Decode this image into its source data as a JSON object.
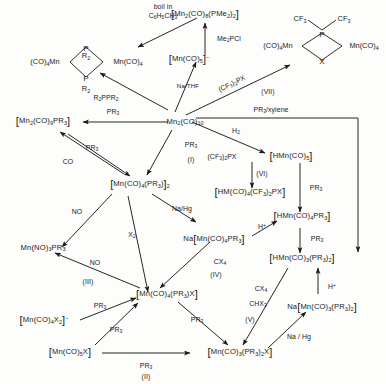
{
  "diagram": {
    "type": "reaction-scheme"
  },
  "structures": {
    "dimer_PR2": {
      "left_label": "(CO)4Mn",
      "right_label": "Mn(CO)4",
      "top_bridge_atom": "P",
      "top_substituent": "R2",
      "bottom_bridge_atom": "P",
      "bottom_substituent": "R2"
    },
    "dimer_CF3_PX": {
      "left_label": "(CO)4Mn",
      "right_label": "Mn(CO)4",
      "top_bridge_atom": "P",
      "top_substituent_left": "CF3",
      "top_substituent_right": "CF3",
      "bottom_bridge_atom": "X"
    }
  },
  "nodes": [
    {
      "id": "mn2co9pme2",
      "text": "[Mn2(CO)8(PMe2)2]"
    },
    {
      "id": "mnco5_anion",
      "text": "[Mn(CO)5]⁻"
    },
    {
      "id": "mn2co9pr3",
      "text": "[Mn2(CO)9PR3]"
    },
    {
      "id": "mn2co10",
      "text": "Mn2(CO)10"
    },
    {
      "id": "hmnco5",
      "text": "[HMn(CO)5]"
    },
    {
      "id": "hmco4cf3px",
      "text": "[HM(CO)4(CF3)2PX]"
    },
    {
      "id": "mnco4pr3_dimer",
      "text": "[Mn(CO)4(PR3)]2"
    },
    {
      "id": "hmnco4pr3",
      "text": "[HMn(CO)4PR3]"
    },
    {
      "id": "mnno3pr3",
      "text": "Mn(NO)3PR3"
    },
    {
      "id": "na_mnco4pr3",
      "text": "Na[Mn(CO)4PR3]"
    },
    {
      "id": "hmnco3pr3_2",
      "text": "[HMn(CO)3(PR3)2]"
    },
    {
      "id": "mnco4x2_anion",
      "text": "[Mn(CO)4X2]⁻"
    },
    {
      "id": "mnco4pr3x",
      "text": "[Mn(CO)4(PR3)X]"
    },
    {
      "id": "na_mnco3pr3_2",
      "text": "Na[Mn(CO)3(PR3)2]"
    },
    {
      "id": "mnco5x",
      "text": "[Mn(CO)5X]"
    },
    {
      "id": "mnco3pr3_2x",
      "text": "[Mn(CO)3(PR3)2X]"
    }
  ],
  "edge_labels": {
    "boil_toluene_line1": "boil  in",
    "boil_toluene_line2": "C6H5CH3",
    "me2pcl": "Me2PCl",
    "r2ppr2": "R2PPR2",
    "na_thf": "Na/THF",
    "cf3_2px_top": "(CF3)2PX",
    "roman_vii": "(VII)",
    "pr3_to_dimer9": "PR3",
    "pr3_xylene": "PR3/xylene",
    "h2": "H2",
    "cf3_2px_mid": "(CF3)2PX",
    "roman_vi": "(VI)",
    "pr3_hmnco5": "PR3",
    "pr3_up": "PR3",
    "co": "CO",
    "pr3_i": "PR3",
    "roman_i": "(I)",
    "no_left": "NO",
    "na_hg_mid": "Na/Hg",
    "x2": "X2",
    "h_plus_1": "H⁺",
    "pr3_hmn": "PR3",
    "no_iii": "NO",
    "roman_iii": "(III)",
    "cx4_iv": "CX4",
    "roman_iv": "(IV)",
    "pr3_anion": "PR3",
    "pr3_mnco5x": "PR3",
    "cx4_v": "CX4",
    "chx3_v": "CHX3",
    "roman_v": "(V)",
    "h_plus_2": "H⁺",
    "pr3_down": "PR3",
    "na_hg_right": "Na / Hg",
    "pr3_ii": "PR3",
    "roman_ii": "(II)"
  },
  "colors": {
    "ink": "#1a1a1a",
    "background": "#fdfdfb"
  }
}
